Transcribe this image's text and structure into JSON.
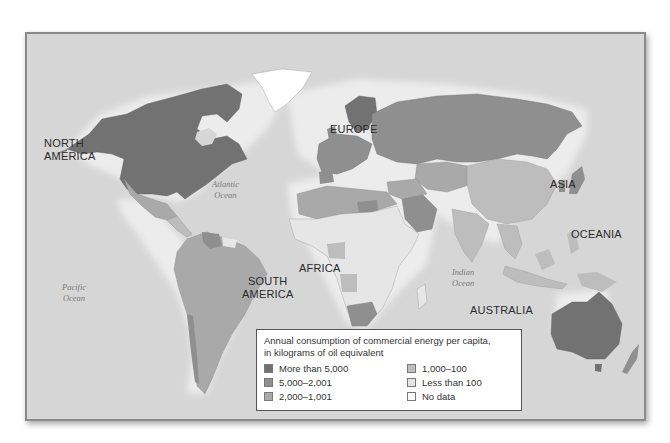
{
  "map": {
    "type": "choropleth world map",
    "continent_labels": {
      "north_america": [
        "NORTH",
        "AMERICA"
      ],
      "south_america": [
        "SOUTH",
        "AMERICA"
      ],
      "europe": "EUROPE",
      "africa": "AFRICA",
      "asia": "ASIA",
      "oceania": "OCEANIA",
      "australia": "AUSTRALIA"
    },
    "ocean_labels": {
      "atlantic": [
        "Atlantic",
        "Ocean"
      ],
      "pacific": [
        "Pacific",
        "Ocean"
      ],
      "indian": [
        "Indian",
        "Ocean"
      ]
    },
    "colors": {
      "ocean": "#d6d6d6",
      "more_than_5000": "#727272",
      "5000_2001": "#8f8f8f",
      "2000_1001": "#a9a9a9",
      "1000_100": "#bdbdbd",
      "less_than_100": "#e6e6e6",
      "no_data": "#ffffff"
    }
  },
  "legend": {
    "title_line1": "Annual consumption of commercial energy per capita,",
    "title_line2": "in kilograms of oil equivalent",
    "items": [
      {
        "label": "More than 5,000",
        "color": "#727272"
      },
      {
        "label": "1,000–100",
        "color": "#bdbdbd"
      },
      {
        "label": "5,000–2,001",
        "color": "#8f8f8f"
      },
      {
        "label": "Less than 100",
        "color": "#e6e6e6"
      },
      {
        "label": "2,000–1,001",
        "color": "#a9a9a9"
      },
      {
        "label": "No data",
        "color": "#ffffff"
      }
    ]
  }
}
